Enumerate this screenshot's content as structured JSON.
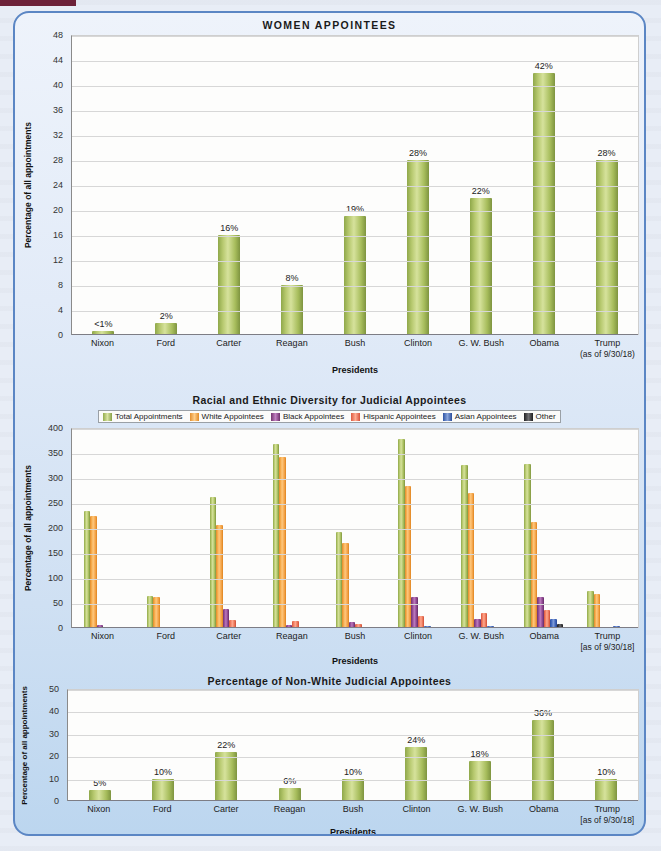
{
  "figure": {
    "presidents": [
      "Nixon",
      "Ford",
      "Carter",
      "Reagan",
      "Bush",
      "Clinton",
      "G. W. Bush",
      "Obama",
      "Trump"
    ],
    "trump_note": "(as of 9/30/18)",
    "trump_note_bracket": "[as of 9/30/18]",
    "xtitle": "Presidents",
    "ytitle": "Percentage of all appointments"
  },
  "chart_data": [
    {
      "type": "bar",
      "title": "WOMEN  APPOINTEES",
      "categories": [
        "Nixon",
        "Ford",
        "Carter",
        "Reagan",
        "Bush",
        "Clinton",
        "G. W. Bush",
        "Obama",
        "Trump"
      ],
      "values": [
        0.6,
        2,
        16,
        8,
        19,
        28,
        22,
        42,
        28
      ],
      "labels": [
        "<1%",
        "2%",
        "16%",
        "8%",
        "19%",
        "28%",
        "22%",
        "42%",
        "28%"
      ],
      "xlabel": "Presidents",
      "ylabel": "Percentage of all appointments",
      "ylim": [
        0,
        48
      ],
      "yticks": [
        0,
        4,
        8,
        12,
        16,
        20,
        24,
        28,
        32,
        36,
        40,
        44,
        48
      ],
      "grid": true,
      "legend": false,
      "series_color": "#a7bd5c"
    },
    {
      "type": "bar",
      "title": "Racial and Ethnic Diversity for Judicial Appointees",
      "categories": [
        "Nixon",
        "Ford",
        "Carter",
        "Reagan",
        "Bush",
        "Clinton",
        "G. W. Bush",
        "Obama",
        "Trump"
      ],
      "xlabel": "Presidents",
      "ylabel": "Percentage of all appointments",
      "ylim": [
        0,
        400
      ],
      "yticks": [
        0,
        50,
        100,
        150,
        200,
        250,
        300,
        350,
        400
      ],
      "grid": true,
      "legend": true,
      "legend_position": "top",
      "series": [
        {
          "name": "Total Appointments",
          "color": "#a7bd5c",
          "values": [
            234,
            65,
            262,
            368,
            193,
            378,
            327,
            329,
            74
          ]
        },
        {
          "name": "White Appointees",
          "color": "#f3a246",
          "values": [
            224,
            62,
            206,
            342,
            170,
            285,
            270,
            212,
            68
          ]
        },
        {
          "name": "Black Appointees",
          "color": "#8c4690",
          "values": [
            6,
            3,
            38,
            7,
            13,
            62,
            18,
            62,
            1
          ]
        },
        {
          "name": "Hispanic Appointees",
          "color": "#ea7557",
          "values": [
            3,
            1,
            16,
            15,
            8,
            25,
            30,
            37,
            1
          ]
        },
        {
          "name": "Asian Appointees",
          "color": "#3f63b8",
          "values": [
            1,
            0,
            2,
            2,
            1,
            5,
            4,
            18,
            5
          ]
        },
        {
          "name": "Other",
          "color": "#39393b",
          "values": [
            0,
            0,
            0,
            1,
            1,
            1,
            2,
            8,
            0
          ]
        }
      ]
    },
    {
      "type": "bar",
      "title": "Percentage of Non-White Judicial Appointees",
      "categories": [
        "Nixon",
        "Ford",
        "Carter",
        "Reagan",
        "Bush",
        "Clinton",
        "G. W. Bush",
        "Obama",
        "Trump"
      ],
      "values": [
        5,
        10,
        22,
        6,
        10,
        24,
        18,
        36,
        10
      ],
      "labels": [
        "5%",
        "10%",
        "22%",
        "6%",
        "10%",
        "24%",
        "18%",
        "36%",
        "10%"
      ],
      "xlabel": "Presidents",
      "ylabel": "Percentage of all appointments",
      "ylim": [
        0,
        50
      ],
      "yticks": [
        0,
        10,
        20,
        30,
        40,
        50
      ],
      "grid": true,
      "legend": false,
      "series_color": "#a7bd5c"
    }
  ],
  "colors": {
    "panel_border": "#5b86c4",
    "page_background": "#e8edf6",
    "top_rule": "#6d2239",
    "plot_background": "#fdfdfc"
  }
}
